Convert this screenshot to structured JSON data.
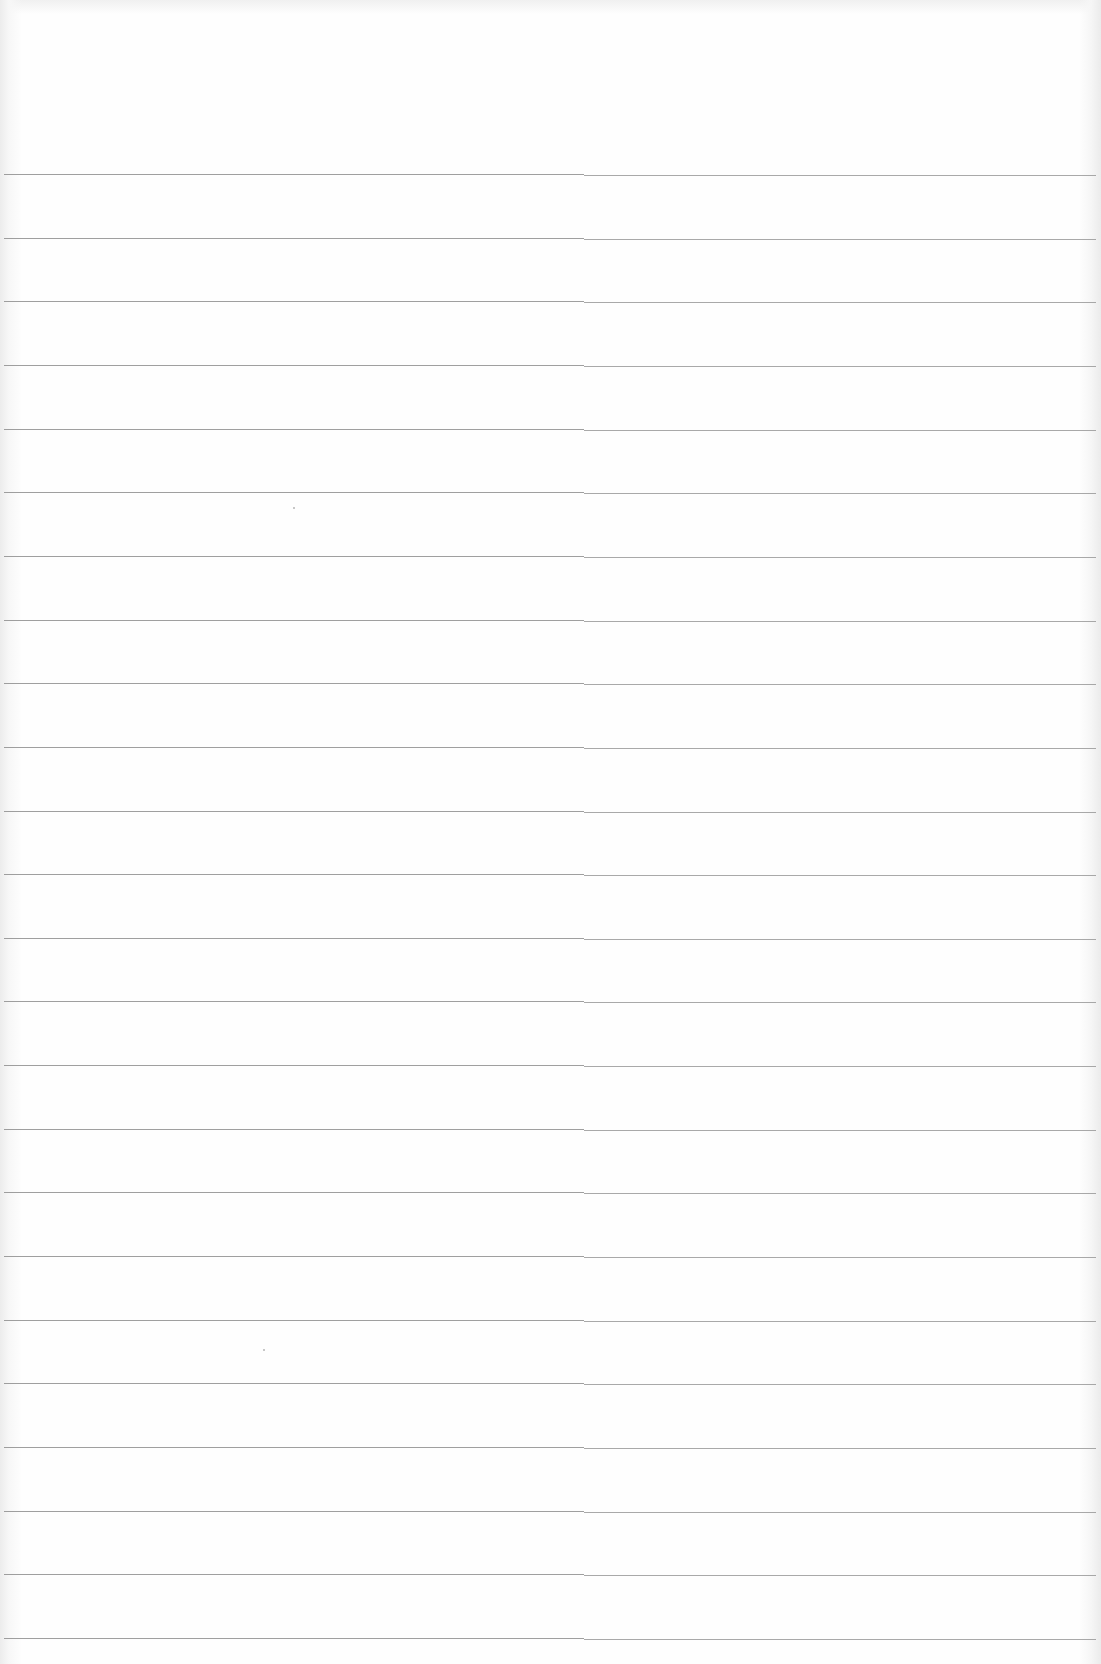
{
  "document": {
    "type": "ruled-paper",
    "background_color": "#fefefe",
    "rule_color": "#8e8e8e",
    "rule_count": 24,
    "first_rule_y": 174,
    "rule_spacing": 63.65,
    "text": []
  }
}
